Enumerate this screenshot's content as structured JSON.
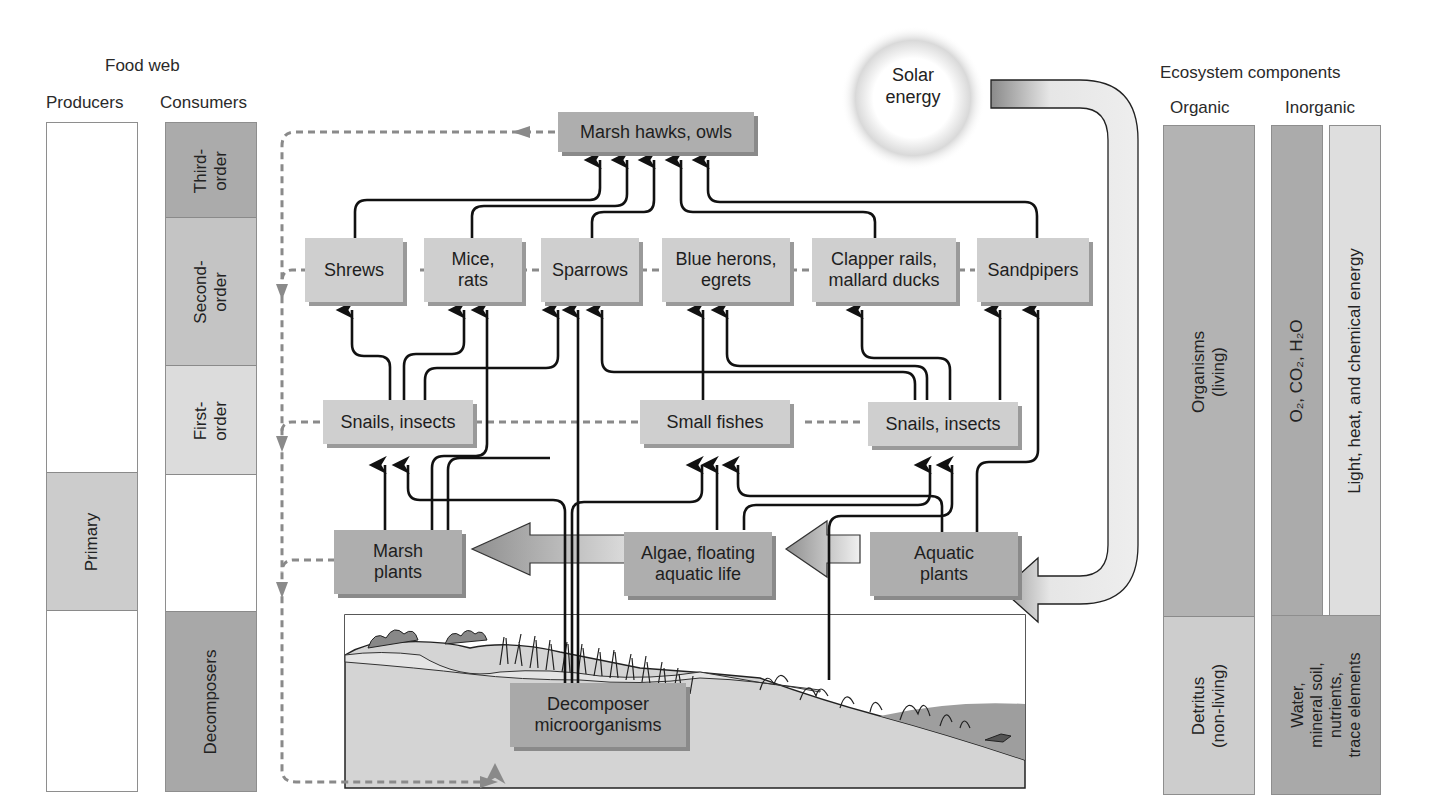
{
  "food_web": {
    "title": "Food web",
    "producers_header": "Producers",
    "consumers_header": "Consumers",
    "producers_segments": [
      {
        "label": "",
        "fill": "#ffffff"
      },
      {
        "label": "Primary",
        "fill": "#cccccc"
      },
      {
        "label": "",
        "fill": "#ffffff"
      }
    ],
    "consumers_segments": [
      {
        "label": "Third-\norder",
        "fill": "#ababab"
      },
      {
        "label": "Second-\norder",
        "fill": "#c4c4c4"
      },
      {
        "label": "First-\norder",
        "fill": "#dcdcdc"
      },
      {
        "label": "",
        "fill": "#ffffff"
      },
      {
        "label": "Decomposers",
        "fill": "#a8a8a8"
      }
    ]
  },
  "ecosystem": {
    "title": "Ecosystem components",
    "organic_header": "Organic",
    "inorganic_header": "Inorganic",
    "organic_segments": [
      {
        "label": "Organisms\n(living)",
        "fill": "#b3b3b3"
      },
      {
        "label": "Detritus\n(non-living)",
        "fill": "#cdcdcd"
      }
    ],
    "gases_label": "O₂, CO₂, H₂O",
    "energy_label": "Light, heat, and chemical energy",
    "minerals_label": "Water,\nmineral soil,\nnutrients,\ntrace elements",
    "colors": {
      "gases": "#ababab",
      "energy": "#dedede",
      "minerals": "#a9a9a9"
    }
  },
  "solar": {
    "label": "Solar\nenergy"
  },
  "nodes": {
    "third_order": "Marsh hawks, owls",
    "second_order": [
      "Shrews",
      "Mice,\nrats",
      "Sparrows",
      "Blue herons,\negrets",
      "Clapper rails,\nmallard ducks",
      "Sandpipers"
    ],
    "first_order": [
      "Snails, insects",
      "Small fishes",
      "Snails, insects"
    ],
    "producers": [
      "Marsh\nplants",
      "Algae, floating\naquatic life",
      "Aquatic\nplants"
    ],
    "decomposers": "Decomposer\nmicroorganisms"
  },
  "colors": {
    "node_light": "#cfcfcf",
    "node_dark": "#aeaeae",
    "arrow": "#111111",
    "dashed": "#8a8a8a"
  }
}
